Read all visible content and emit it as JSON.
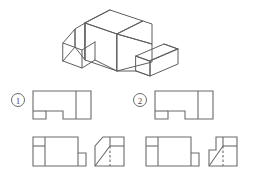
{
  "figure": {
    "kind": "orthographic-projection-exercise",
    "background_color": "#ffffff",
    "line_color": "#6b6b6b",
    "dark_line_color": "#555555",
    "canvas": {
      "width": 253,
      "height": 177
    }
  },
  "pictorial": {
    "title": "isometric-block",
    "description": "Rectangular block with chamfered left-front face, a stepped notch, and a wedge prism with sloped top at the right-front"
  },
  "options": [
    {
      "id": "option-1",
      "label": "①",
      "number": "1",
      "views": [
        {
          "name": "top-view",
          "label": "top"
        },
        {
          "name": "front-view",
          "label": "front"
        },
        {
          "name": "side-view",
          "label": "side",
          "corner": "full-diagonal-chamfer",
          "hidden_line": "dashed-vertical"
        }
      ]
    },
    {
      "id": "option-2",
      "label": "②",
      "number": "2",
      "views": [
        {
          "name": "top-view",
          "label": "top"
        },
        {
          "name": "front-view",
          "label": "front"
        },
        {
          "name": "side-view",
          "label": "side",
          "corner": "stepped-notch-then-diagonal",
          "hidden_line": "dashed-vertical"
        }
      ]
    }
  ]
}
